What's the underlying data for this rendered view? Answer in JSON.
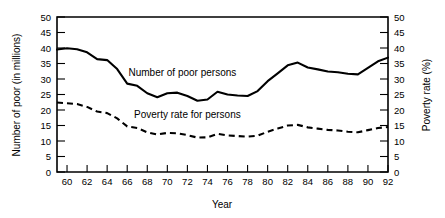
{
  "chart_data": {
    "type": "line",
    "title": "",
    "xlabel": "Year",
    "ylabel": "Number of poor (in millions)",
    "y2label": "Poverty rate (%)",
    "xlim": [
      1959,
      1992
    ],
    "ylim": [
      0,
      50
    ],
    "y2lim": [
      0,
      50
    ],
    "grid": false,
    "legend_position": "inline-annotation",
    "x_tick_labels": [
      "60",
      "62",
      "64",
      "66",
      "68",
      "70",
      "72",
      "74",
      "76",
      "78",
      "80",
      "82",
      "84",
      "86",
      "88",
      "90",
      "92"
    ],
    "x_tick_values": [
      1960,
      1962,
      1964,
      1966,
      1968,
      1970,
      1972,
      1974,
      1976,
      1978,
      1980,
      1982,
      1984,
      1986,
      1988,
      1990,
      1992
    ],
    "y_tick_labels": [
      "0",
      "5",
      "10",
      "15",
      "20",
      "25",
      "30",
      "35",
      "40",
      "45",
      "50"
    ],
    "y_tick_values": [
      0,
      5,
      10,
      15,
      20,
      25,
      30,
      35,
      40,
      45,
      50
    ],
    "y2_tick_labels": [
      "0",
      "5",
      "10",
      "15",
      "20",
      "25",
      "30",
      "35",
      "40",
      "45",
      "50"
    ],
    "y2_tick_values": [
      0,
      5,
      10,
      15,
      20,
      25,
      30,
      35,
      40,
      45,
      50
    ],
    "x": [
      1959,
      1960,
      1961,
      1962,
      1963,
      1964,
      1965,
      1966,
      1967,
      1968,
      1969,
      1970,
      1971,
      1972,
      1973,
      1974,
      1975,
      1976,
      1977,
      1978,
      1979,
      1980,
      1981,
      1982,
      1983,
      1984,
      1985,
      1986,
      1987,
      1988,
      1989,
      1990,
      1991,
      1992
    ],
    "series": [
      {
        "name": "Number of poor persons",
        "axis": "left",
        "style": "solid",
        "label_text": "Number of poor persons",
        "values": [
          39.5,
          39.9,
          39.6,
          38.6,
          36.4,
          36.1,
          33.2,
          28.5,
          27.8,
          25.4,
          24.1,
          25.4,
          25.6,
          24.5,
          23.0,
          23.4,
          25.9,
          25.0,
          24.7,
          24.5,
          26.1,
          29.3,
          31.8,
          34.4,
          35.3,
          33.7,
          33.1,
          32.4,
          32.2,
          31.7,
          31.5,
          33.6,
          35.7,
          36.9
        ]
      },
      {
        "name": "Poverty rate for persons",
        "axis": "right",
        "style": "dashed",
        "label_text": "Poverty rate for persons",
        "values": [
          22.4,
          22.2,
          21.9,
          21.0,
          19.5,
          19.0,
          17.3,
          14.7,
          14.2,
          12.8,
          12.1,
          12.6,
          12.5,
          11.9,
          11.1,
          11.2,
          12.3,
          11.8,
          11.6,
          11.4,
          11.7,
          13.0,
          14.0,
          15.0,
          15.2,
          14.4,
          14.0,
          13.6,
          13.4,
          13.0,
          12.8,
          13.5,
          14.2,
          14.5
        ]
      }
    ],
    "annotations": [
      {
        "text": "Number of poor persons",
        "x": 1971.5,
        "y": 31.0
      },
      {
        "text": "Poverty rate for persons",
        "x": 1972.0,
        "y": 17.5
      }
    ]
  }
}
